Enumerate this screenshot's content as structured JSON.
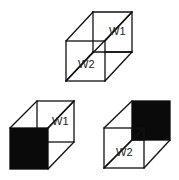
{
  "diagram": {
    "cubes": [
      {
        "id": "top",
        "filled_face": "none",
        "labels": {
          "back": "W1",
          "front": "W2"
        }
      },
      {
        "id": "bottom-left",
        "filled_face": "front",
        "labels": {
          "back": "W1"
        }
      },
      {
        "id": "bottom-right",
        "filled_face": "back",
        "labels": {
          "front": "W2"
        }
      }
    ],
    "colors": {
      "line": "#111111",
      "filled": "#0a0a0a",
      "background": "#ffffff"
    }
  }
}
